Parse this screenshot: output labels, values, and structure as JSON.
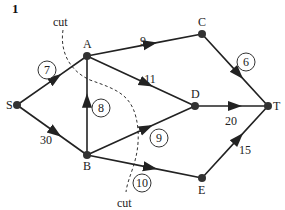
{
  "figure": {
    "number": "1"
  },
  "cut_label": "cut",
  "nodes": [
    {
      "id": "S",
      "x": 17,
      "y": 105,
      "lx": 6,
      "ly": 109
    },
    {
      "id": "A",
      "x": 87,
      "y": 56,
      "lx": 83,
      "ly": 48
    },
    {
      "id": "B",
      "x": 87,
      "y": 155,
      "lx": 83,
      "ly": 170
    },
    {
      "id": "C",
      "x": 202,
      "y": 34,
      "lx": 198,
      "ly": 26
    },
    {
      "id": "D",
      "x": 195,
      "y": 106,
      "lx": 191,
      "ly": 98
    },
    {
      "id": "T",
      "x": 268,
      "y": 106,
      "lx": 273,
      "ly": 110
    },
    {
      "id": "E",
      "x": 202,
      "y": 178,
      "lx": 198,
      "ly": 194
    }
  ],
  "edges": [
    {
      "from": "S",
      "to": "A",
      "label": "7",
      "circled": true,
      "lx": 47,
      "ly": 70
    },
    {
      "from": "S",
      "to": "B",
      "label": "30",
      "circled": false,
      "lx": 46,
      "ly": 140
    },
    {
      "from": "B",
      "to": "A",
      "label": "8",
      "circled": true,
      "lx": 101,
      "ly": 108
    },
    {
      "from": "A",
      "to": "C",
      "label": "9",
      "circled": false,
      "lx": 143,
      "ly": 41
    },
    {
      "from": "A",
      "to": "D",
      "label": "11",
      "circled": false,
      "lx": 150,
      "ly": 79
    },
    {
      "from": "B",
      "to": "D",
      "label": "9",
      "circled": true,
      "lx": 159,
      "ly": 138
    },
    {
      "from": "B",
      "to": "E",
      "label": "10",
      "circled": true,
      "lx": 142,
      "ly": 183
    },
    {
      "from": "C",
      "to": "T",
      "label": "6",
      "circled": true,
      "lx": 246,
      "ly": 62
    },
    {
      "from": "D",
      "to": "T",
      "label": "20",
      "circled": false,
      "lx": 231,
      "ly": 121
    },
    {
      "from": "E",
      "to": "T",
      "label": "15",
      "circled": false,
      "lx": 245,
      "ly": 150
    }
  ],
  "cut": {
    "path": "M 63 30 C 60 50, 68 70, 90 80 C 118 90, 135 95, 138 130 C 140 160, 128 175, 126 192",
    "top_label": {
      "text": "cut",
      "x": 53,
      "y": 26
    },
    "bottom_label": {
      "text": "cut",
      "x": 117,
      "y": 207
    }
  }
}
